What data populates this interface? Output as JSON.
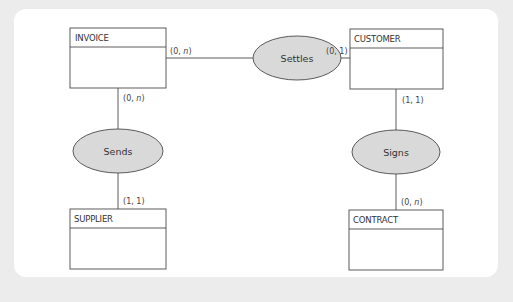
{
  "diagram": {
    "type": "entity-relationship",
    "entities": [
      {
        "id": "invoice",
        "name": "INVOICE"
      },
      {
        "id": "customer",
        "name": "CUSTOMER"
      },
      {
        "id": "supplier",
        "name": "SUPPLIER"
      },
      {
        "id": "contract",
        "name": "CONTRACT"
      }
    ],
    "relationships": [
      {
        "id": "settles",
        "name": "Settles",
        "between": [
          "INVOICE",
          "CUSTOMER"
        ],
        "cardinalities": {
          "invoice_side": {
            "min": "0",
            "max": "n"
          },
          "customer_side": {
            "min": "0",
            "max": "1"
          }
        }
      },
      {
        "id": "sends",
        "name": "Sends",
        "between": [
          "INVOICE",
          "SUPPLIER"
        ],
        "cardinalities": {
          "invoice_side": {
            "min": "0",
            "max": "n"
          },
          "supplier_side": {
            "min": "1",
            "max": "1"
          }
        }
      },
      {
        "id": "signs",
        "name": "Signs",
        "between": [
          "CUSTOMER",
          "CONTRACT"
        ],
        "cardinalities": {
          "customer_side": {
            "min": "1",
            "max": "1"
          },
          "contract_side": {
            "min": "0",
            "max": "n"
          }
        }
      }
    ],
    "colors": {
      "background": "#ececec",
      "panel": "#ffffff",
      "relationship_fill": "#d9d9d9",
      "stroke": "#4a4a4a"
    }
  }
}
